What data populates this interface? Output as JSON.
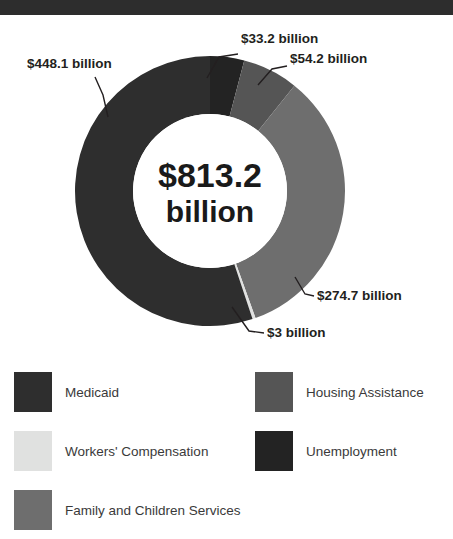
{
  "topbar": {
    "color": "#2d2d2d"
  },
  "center": {
    "amount": "$813.2",
    "unit": "billion"
  },
  "callouts": [
    {
      "key": "medicaid",
      "text": "$448.1 billion"
    },
    {
      "key": "unemployment",
      "text": "$33.2 billion"
    },
    {
      "key": "housing",
      "text": "$54.2 billion"
    },
    {
      "key": "family",
      "text": "$274.7 billion"
    },
    {
      "key": "workers",
      "text": "$3 billion"
    }
  ],
  "legend": {
    "left": [
      {
        "label": "Medicaid",
        "color": "#2e2e2e"
      },
      {
        "label": "Workers' Compensation",
        "color": "#e0e1e0"
      },
      {
        "label": "Family and Children Services",
        "color": "#6e6e6e"
      }
    ],
    "right": [
      {
        "label": "Housing Assistance",
        "color": "#555555"
      },
      {
        "label": "Unemployment",
        "color": "#232323"
      }
    ]
  },
  "chart_data": {
    "type": "pie",
    "title": "$813.2 billion",
    "total": 813.2,
    "unit": "billion USD",
    "hole": 0.57,
    "start_angle_deg": 0,
    "direction": "clockwise",
    "categories": [
      "Unemployment",
      "Housing Assistance",
      "Family and Children Services",
      "Workers' Compensation",
      "Medicaid"
    ],
    "values": [
      33.2,
      54.2,
      274.7,
      3,
      448.1
    ],
    "labels": [
      "$33.2 billion",
      "$54.2 billion",
      "$274.7 billion",
      "$3 billion",
      "$448.1 billion"
    ],
    "colors": [
      "#232323",
      "#555555",
      "#6e6e6e",
      "#e0e1e0",
      "#2e2e2e"
    ],
    "legend_position": "bottom",
    "grid": false,
    "xlabel": "",
    "ylabel": ""
  }
}
